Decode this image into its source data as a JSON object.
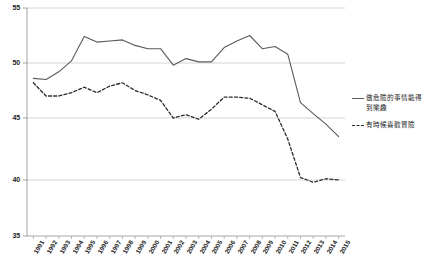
{
  "chart_data": {
    "type": "line",
    "title": "",
    "xlabel": "",
    "ylabel": "",
    "ylim": [
      35,
      55
    ],
    "yticks": [
      35,
      40,
      45,
      50,
      55
    ],
    "grid": true,
    "legend_position": "right",
    "categories": [
      "1991",
      "1992",
      "1993",
      "1994",
      "1995",
      "1996",
      "1997",
      "1998",
      "1999",
      "2000",
      "2001",
      "2002",
      "2003",
      "2004",
      "2005",
      "2006",
      "2007",
      "2008",
      "2009",
      "2010",
      "2011",
      "2012",
      "2013",
      "2014",
      "2015"
    ],
    "series": [
      {
        "name": "做危險的事情能得到樂趣",
        "style": "solid",
        "color": "#5a5a5a",
        "values": [
          48.6,
          48.5,
          49.2,
          50.2,
          52.4,
          51.9,
          52.0,
          52.1,
          51.6,
          51.3,
          51.3,
          49.8,
          50.4,
          50.1,
          50.1,
          51.4,
          52.0,
          52.5,
          51.3,
          51.5,
          50.8,
          46.4,
          45.4,
          44.5,
          43.5
        ]
      },
      {
        "name": "有時候喜歡冒險",
        "style": "dashed",
        "color": "#2b2b2b",
        "values": [
          48.2,
          47.0,
          47.0,
          47.3,
          47.8,
          47.3,
          47.9,
          48.2,
          47.5,
          47.1,
          46.6,
          45.0,
          45.3,
          44.9,
          45.8,
          46.9,
          46.9,
          46.8,
          46.2,
          45.6,
          43.3,
          40.2,
          39.8,
          40.1,
          40.0
        ]
      }
    ]
  },
  "legend": {
    "items": [
      {
        "label": "做危險的事情能得到樂趣",
        "style": "solid"
      },
      {
        "label": "有時候喜歡冒險",
        "style": "dashed"
      }
    ]
  }
}
